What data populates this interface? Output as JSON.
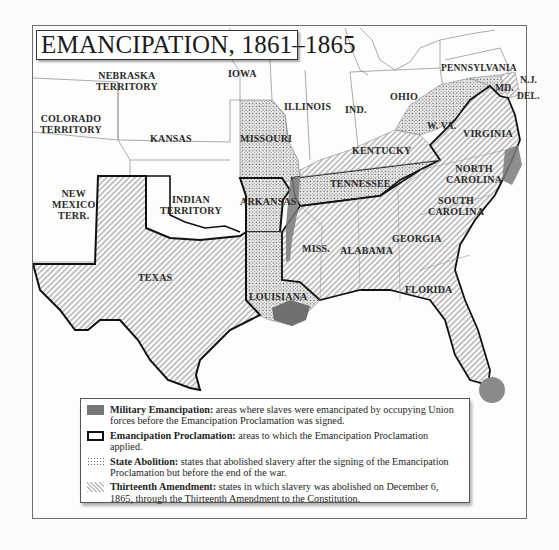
{
  "title": "EMANCIPATION, 1861–1865",
  "colors": {
    "military_emancipation": "#777777",
    "proclamation_border": "#111111",
    "state_abolition_dots": "#666666",
    "thirteenth_amendment_hatch": "#bbbbbb",
    "frame": "#6e6e6e"
  },
  "map_labels": {
    "nebraska": "NEBRASKA\nTERRITORY",
    "nebraska_l1": "NEBRASKA",
    "nebraska_l2": "TERRITORY",
    "iowa": "IOWA",
    "illinois": "ILLINOIS",
    "indiana": "IND.",
    "ohio": "OHIO",
    "pennsylvania": "PENNSYLVANIA",
    "new_jersey": "N.J.",
    "maryland": "MD.",
    "delaware": "DEL.",
    "colorado_l1": "COLORADO",
    "colorado_l2": "TERRITORY",
    "kansas": "KANSAS",
    "missouri": "MISSOURI",
    "west_virginia": "W. VA.",
    "virginia": "VIRGINIA",
    "kentucky": "KENTUCKY",
    "tennessee": "TENNESSEE",
    "north_carolina_l1": "NORTH",
    "north_carolina_l2": "CAROLINA",
    "south_carolina_l1": "SOUTH",
    "south_carolina_l2": "CAROLINA",
    "new_mexico_l1": "NEW",
    "new_mexico_l2": "MEXICO",
    "new_mexico_l3": "TERR.",
    "indian_l1": "INDIAN",
    "indian_l2": "TERRITORY",
    "arkansas": "ARKANSAS",
    "mississippi": "MISS.",
    "alabama": "ALABAMA",
    "georgia": "GEORGIA",
    "texas": "TEXAS",
    "louisiana": "LOUISIANA",
    "florida": "FLORIDA"
  },
  "legend": [
    {
      "key": "military",
      "icon": "gray-filled-swatch",
      "term": "Military Emancipation:",
      "desc": " areas where slaves were emancipated by occupying Union forces before the Emancipation Proclamation was signed."
    },
    {
      "key": "proclamation",
      "icon": "bold-outline-swatch",
      "term": "Emancipation Proclamation:",
      "desc": " areas to which the Emancipation Proclamation applied."
    },
    {
      "key": "state",
      "icon": "dotted-swatch",
      "term": "State Abolition:",
      "desc": " states that abolished slavery after the signing of the Emancipation Proclamation but before the end of the war."
    },
    {
      "key": "thirteenth",
      "icon": "hatched-swatch",
      "term": "Thirteenth Amendment:",
      "desc": " states in which slavery was abolished on December 6, 1865, through the Thirteenth Amendment to the Constitution."
    }
  ]
}
